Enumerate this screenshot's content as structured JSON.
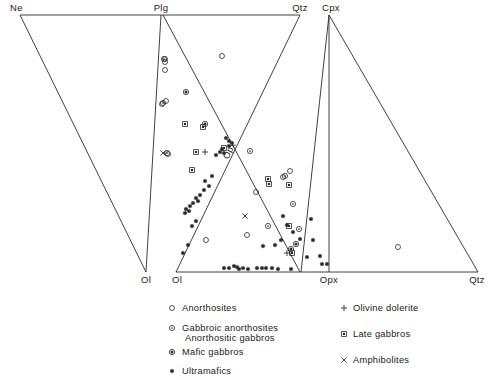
{
  "figure": {
    "title": "",
    "vertices": [
      {
        "name": "Ne",
        "label": "Ne",
        "x": 20,
        "y": 15
      },
      {
        "name": "Plg",
        "label": "Plg",
        "x": 161,
        "y": 15
      },
      {
        "name": "Qtz-top",
        "label": "Qtz",
        "x": 300,
        "y": 15
      },
      {
        "name": "Cpx",
        "label": "Cpx",
        "x": 329,
        "y": 15
      },
      {
        "name": "Ol-left",
        "label": "Ol",
        "x": 146,
        "y": 272
      },
      {
        "name": "Ol-right",
        "label": "Ol",
        "x": 176,
        "y": 272
      },
      {
        "name": "Opx",
        "label": "Opx",
        "x": 329,
        "y": 272
      },
      {
        "name": "Qtz-bottom",
        "label": "Qtz",
        "x": 478,
        "y": 272
      }
    ],
    "inner_label": {
      "text": "Opx",
      "x": 232,
      "y": 152,
      "rotation": -62
    }
  },
  "chart_data": {
    "type": "scatter",
    "xlabel": "",
    "ylabel": "",
    "grid": false,
    "legend_position": "bottom",
    "panels": [
      {
        "name": "left-panel",
        "corners": [
          "Ne",
          "Plg",
          "Ol"
        ],
        "ne_x": 20,
        "ne_y": 15,
        "plg_x": 161,
        "plg_y": 15,
        "ol_x": 146,
        "ol_y": 272
      },
      {
        "name": "middle-panel",
        "corners": [
          "Plg",
          "Qtz",
          "Ol"
        ],
        "plg_x": 161,
        "plg_y": 15,
        "qtz_x": 300,
        "qtz_y": 15,
        "ol_x": 176,
        "ol_y": 272
      },
      {
        "name": "right-panel",
        "corners": [
          "Cpx",
          "Opx",
          "Qtz"
        ],
        "cpx_x": 329,
        "cpx_y": 15,
        "opx_x": 329,
        "opx_y": 272,
        "qtz_x": 478,
        "qtz_y": 272
      }
    ],
    "series": [
      {
        "name": "Anorthosites",
        "symbol": "open-circle",
        "points": [
          [
            165,
            59
          ],
          [
            165,
            62
          ],
          [
            165,
            70
          ],
          [
            222,
            56
          ],
          [
            162,
            104
          ],
          [
            166,
            101
          ],
          [
            168,
            154
          ],
          [
            283,
            177
          ],
          [
            290,
            171
          ],
          [
            256,
            192
          ],
          [
            247,
            235
          ],
          [
            206,
            240
          ],
          [
            398,
            247
          ]
        ]
      },
      {
        "name": "Gabbroic anorthosites / Anorthositic gabbros",
        "symbol": "circle-dot-small",
        "points": [
          [
            164,
            59
          ],
          [
            163,
            103
          ],
          [
            167,
            153
          ],
          [
            250,
            151
          ],
          [
            285,
            176
          ],
          [
            293,
            204
          ],
          [
            299,
            229
          ],
          [
            268,
            226
          ]
        ]
      },
      {
        "name": "Mafic gabbros",
        "symbol": "circle-filled-center",
        "points": [
          [
            186,
            92
          ],
          [
            205,
            124
          ],
          [
            296,
            244
          ],
          [
            291,
            249
          ]
        ]
      },
      {
        "name": "Ultramafics",
        "symbol": "solid-dot",
        "points": [
          [
            226,
            138
          ],
          [
            229,
            141
          ],
          [
            232,
            143
          ],
          [
            229,
            146
          ],
          [
            222,
            149
          ],
          [
            220,
            152
          ],
          [
            224,
            153
          ],
          [
            216,
            155
          ],
          [
            212,
            176
          ],
          [
            205,
            181
          ],
          [
            209,
            186
          ],
          [
            204,
            190
          ],
          [
            200,
            195
          ],
          [
            196,
            198
          ],
          [
            198,
            201
          ],
          [
            193,
            203
          ],
          [
            190,
            206
          ],
          [
            186,
            209
          ],
          [
            189,
            211
          ],
          [
            185,
            213
          ],
          [
            196,
            221
          ],
          [
            192,
            226
          ],
          [
            188,
            245
          ],
          [
            183,
            253
          ],
          [
            283,
            216
          ],
          [
            287,
            225
          ],
          [
            293,
            232
          ],
          [
            281,
            240
          ],
          [
            275,
            245
          ],
          [
            263,
            246
          ],
          [
            300,
            239
          ],
          [
            311,
            219
          ],
          [
            313,
            240
          ],
          [
            320,
            256
          ],
          [
            307,
            257
          ],
          [
            322,
            264
          ],
          [
            327,
            264
          ],
          [
            224,
            268
          ],
          [
            229,
            268
          ],
          [
            234,
            266
          ],
          [
            237,
            267
          ],
          [
            239,
            269
          ],
          [
            243,
            268
          ],
          [
            248,
            269
          ],
          [
            257,
            268
          ],
          [
            262,
            268
          ],
          [
            266,
            268
          ],
          [
            272,
            268
          ],
          [
            278,
            269
          ],
          [
            291,
            269
          ]
        ]
      },
      {
        "name": "Olivine dolerite",
        "symbol": "plus",
        "points": [
          [
            205,
            152
          ],
          [
            287,
            253
          ]
        ]
      },
      {
        "name": "Late gabbros",
        "symbol": "small-square",
        "points": [
          [
            185,
            124
          ],
          [
            203,
            127
          ],
          [
            224,
            148
          ],
          [
            196,
            152
          ],
          [
            192,
            170
          ],
          [
            268,
            179
          ],
          [
            269,
            184
          ],
          [
            289,
            185
          ],
          [
            292,
            253
          ],
          [
            289,
            226
          ]
        ]
      },
      {
        "name": "Amphibolites",
        "symbol": "cross",
        "points": [
          [
            163,
            153
          ],
          [
            245,
            216
          ]
        ]
      }
    ]
  },
  "legend": {
    "left_column": [
      {
        "symbol": "open-circle",
        "label": "Anorthosites",
        "label2": ""
      },
      {
        "symbol": "circle-dot-small",
        "label": "Gabbroic anorthosites",
        "label2": "Anorthositic  gabbros"
      },
      {
        "symbol": "circle-filled-center",
        "label": "Mafic gabbros",
        "label2": ""
      },
      {
        "symbol": "solid-dot",
        "label": "Ultramafics",
        "label2": ""
      }
    ],
    "right_column": [
      {
        "symbol": "plus",
        "label": "Olivine  dolerite"
      },
      {
        "symbol": "small-square",
        "label": "Late  gabbros"
      },
      {
        "symbol": "cross",
        "label": "Amphibolites"
      }
    ]
  },
  "colors": {
    "line": "#2b2b2b",
    "text": "#1a1a1a",
    "background": "#ffffff"
  }
}
